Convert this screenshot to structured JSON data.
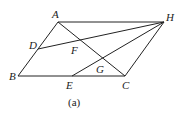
{
  "figure": {
    "caption": "(a)",
    "points": {
      "A": {
        "label": "A",
        "x": 58,
        "y": 22
      },
      "H": {
        "label": "H",
        "x": 164,
        "y": 22
      },
      "B": {
        "label": "B",
        "x": 18,
        "y": 76
      },
      "C": {
        "label": "C",
        "x": 125,
        "y": 76
      },
      "D": {
        "label": "D",
        "x": 38,
        "y": 49
      },
      "E": {
        "label": "E",
        "x": 72,
        "y": 76
      },
      "F": {
        "label": "F",
        "x": 75,
        "y": 40
      },
      "G": {
        "label": "G",
        "x": 100,
        "y": 58
      }
    },
    "segments": [
      [
        "A",
        "H"
      ],
      [
        "A",
        "B"
      ],
      [
        "B",
        "C"
      ],
      [
        "C",
        "H"
      ],
      [
        "A",
        "C"
      ],
      [
        "D",
        "H"
      ],
      [
        "E",
        "H"
      ]
    ]
  }
}
